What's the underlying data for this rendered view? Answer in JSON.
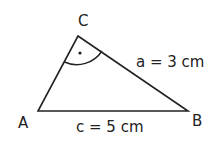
{
  "diagram": {
    "type": "right-triangle",
    "vertices": {
      "A": {
        "label": "A",
        "x": 38,
        "y": 111
      },
      "B": {
        "label": "B",
        "x": 188,
        "y": 111
      },
      "C": {
        "label": "C",
        "x": 78,
        "y": 36
      }
    },
    "right_angle_at": "C",
    "labels": {
      "side_a": "a = 3 cm",
      "side_c": "c = 5 cm"
    },
    "colors": {
      "stroke": "#222222",
      "background": "#ffffff"
    }
  }
}
